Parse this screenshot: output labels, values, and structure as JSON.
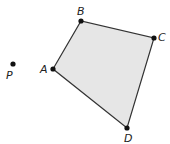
{
  "diagram": {
    "shape": "quadrilateral",
    "fill_color": "#e6e6e6",
    "stroke_color": "#333333",
    "vertices": [
      {
        "label": "A",
        "x": 53,
        "y": 69
      },
      {
        "label": "B",
        "x": 81,
        "y": 21
      },
      {
        "label": "C",
        "x": 154,
        "y": 38
      },
      {
        "label": "D",
        "x": 127,
        "y": 128
      }
    ],
    "external_point": {
      "label": "P",
      "x": 13,
      "y": 64
    }
  }
}
